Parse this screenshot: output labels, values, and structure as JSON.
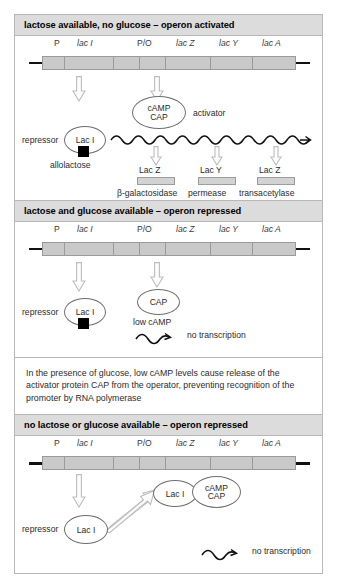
{
  "gene_map": {
    "labels": [
      "P",
      "lac I",
      "P/O",
      "lac Z",
      "lac Y",
      "lac A"
    ],
    "italic": [
      false,
      true,
      false,
      true,
      true,
      true
    ]
  },
  "panels": [
    {
      "id": "panel-activated",
      "header": "lactose available, no glucose – operon activated",
      "repressor_label": "repressor",
      "repressor_oval": "Lac I",
      "allolactose_label": "allolactose",
      "activator_oval_line1": "cAMP",
      "activator_oval_line2": "CAP",
      "activator_label": "activator",
      "products": [
        {
          "gene": "Lac Z",
          "enzyme": "β-galactosidase"
        },
        {
          "gene": "Lac Y",
          "enzyme": "permease"
        },
        {
          "gene": "Lac Z",
          "enzyme": "transacetylase"
        }
      ]
    },
    {
      "id": "panel-repressed-glucose",
      "header": "lactose and glucose available – operon repressed",
      "repressor_label": "repressor",
      "repressor_oval": "Lac I",
      "cap_oval": "CAP",
      "low_camp_label": "low cAMP",
      "no_transcription_label": "no transcription"
    },
    {
      "id": "panel-repressed-none",
      "header": "no lactose or glucose available – operon repressed",
      "repressor_label": "repressor",
      "repressor_oval": "Lac I",
      "bound_oval": "Lac I",
      "camp_oval_line1": "cAMP",
      "camp_oval_line2": "CAP",
      "no_transcription_label": "no transcription"
    }
  ],
  "note": {
    "text": "In the presence of glucose, low cAMP levels cause release of the activator protein CAP from the operator, preventing recognition of the promoter by RNA polymerase"
  },
  "colors": {
    "header_bg": "#dcdcdc",
    "gene_bar": "#c9c9c9",
    "border": "#b8b8b8",
    "arrow_outline": "#bcbcbc",
    "text": "#2b2b2b",
    "allolactose": "#000000"
  }
}
